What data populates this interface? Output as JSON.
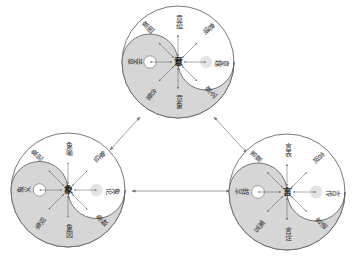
{
  "diagram": {
    "colors": {
      "background": "#ffffff",
      "circle_stroke": "#555555",
      "yin_fill": "#d6d6d6",
      "yang_fill": "#ffffff",
      "arrow": "#777777",
      "dot_light": "#e4e4e4",
      "text": "#333333"
    },
    "circles": [
      {
        "id": "top",
        "center_char": "意",
        "labels": {
          "top": "意蕴",
          "top_right": "意境",
          "right": "意趣",
          "bottom_right": "意念",
          "bottom": "意象",
          "bottom_left": "合意",
          "left": "意会",
          "top_left": "意图"
        }
      },
      {
        "id": "bottom-left",
        "center_char": "象",
        "labels": {
          "top": "象喻",
          "top_right": "象征",
          "right": "象论",
          "bottom_right": "象数",
          "bottom": "象図",
          "bottom_left": "现象",
          "left": "象义",
          "top_left": "象思"
        }
      },
      {
        "id": "bottom-right",
        "center_char": "言",
        "labels": {
          "top": "言表",
          "top_right": "言说",
          "right": "言传",
          "bottom_right": "言语",
          "bottom": "言诠",
          "bottom_left": "寓言",
          "left": "言辞",
          "top_left": "言意"
        }
      }
    ],
    "connections": [
      {
        "from": "top",
        "to": "bottom-left",
        "type": "double-arrow"
      },
      {
        "from": "top",
        "to": "bottom-right",
        "type": "double-arrow"
      },
      {
        "from": "bottom-left",
        "to": "bottom-right",
        "type": "double-arrow"
      }
    ]
  }
}
